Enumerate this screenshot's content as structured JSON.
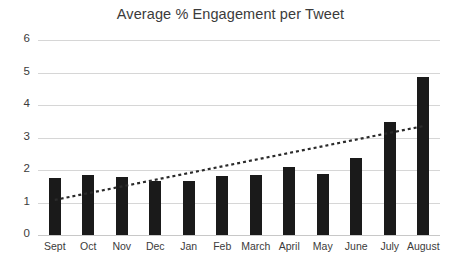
{
  "chart_data": {
    "type": "bar",
    "title": "Average % Engagement per Tweet",
    "xlabel": "",
    "ylabel": "",
    "categories": [
      "Sept",
      "Oct",
      "Nov",
      "Dec",
      "Jan",
      "Feb",
      "March",
      "April",
      "May",
      "June",
      "July",
      "August"
    ],
    "values": [
      1.75,
      1.85,
      1.8,
      1.66,
      1.67,
      1.82,
      1.85,
      2.08,
      1.88,
      2.37,
      3.48,
      4.85
    ],
    "series": [
      {
        "name": "Average % Engagement per Tweet",
        "values": [
          1.75,
          1.85,
          1.8,
          1.66,
          1.67,
          1.82,
          1.85,
          2.08,
          1.88,
          2.37,
          3.48,
          4.85
        ],
        "color": "#1a1a1a"
      }
    ],
    "ylim": [
      0,
      6
    ],
    "yticks": [
      0,
      1,
      2,
      3,
      4,
      5,
      6
    ],
    "ytick_labels": [
      "0",
      "1",
      "2",
      "3",
      "4",
      "5",
      "6"
    ],
    "grid": true,
    "legend": false,
    "legend_position": "none",
    "trendline": {
      "type": "linear",
      "style": "dotted",
      "color": "#2b2b2b",
      "start_value": 1.08,
      "end_value": 3.35
    }
  },
  "colors": {
    "bar": "#1a1a1a",
    "gridline": "#d6d6d6",
    "text": "#3b3b3b",
    "background": "#ffffff"
  }
}
